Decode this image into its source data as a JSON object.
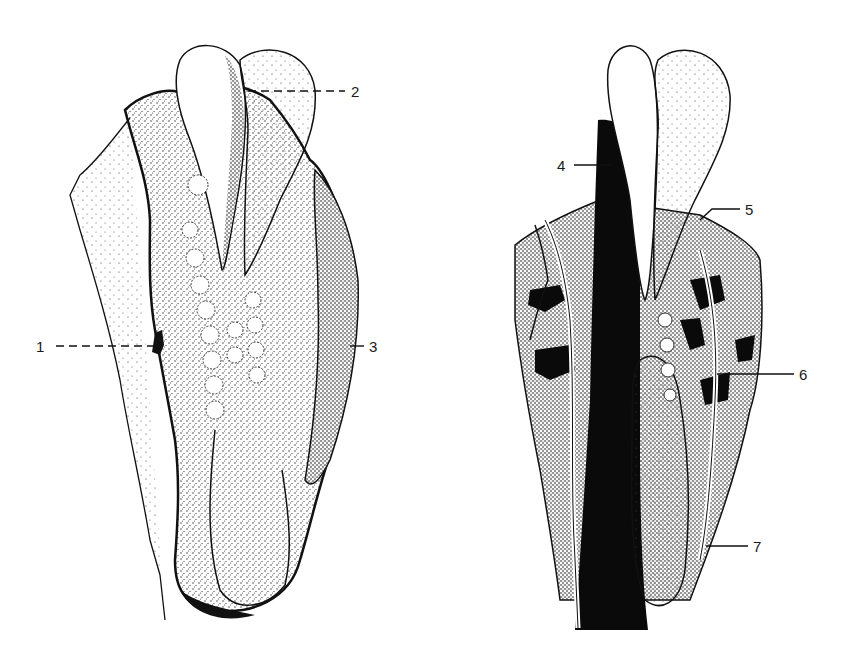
{
  "figure": {
    "panels": [
      {
        "id": "left",
        "description": "external view of stippled embryonic structure with paired distal lobes"
      },
      {
        "id": "right",
        "description": "sectioned view of the same structure showing dark internal cavity"
      }
    ],
    "labels": [
      {
        "text": "1",
        "x": 36,
        "y": 339,
        "leader": "dashed",
        "x1": 56,
        "y1": 346,
        "x2": 158,
        "y2": 346
      },
      {
        "text": "2",
        "x": 351,
        "y": 84,
        "leader": "dashed",
        "x1": 248,
        "y1": 91,
        "x2": 345,
        "y2": 91
      },
      {
        "text": "3",
        "x": 369,
        "y": 339,
        "leader": "solid",
        "x1": 350,
        "y1": 346,
        "x2": 362,
        "y2": 346
      },
      {
        "text": "4",
        "x": 557,
        "y": 158,
        "leader": "solid",
        "x1": 574,
        "y1": 165,
        "x2": 611,
        "y2": 165
      },
      {
        "text": "5",
        "x": 745,
        "y": 209,
        "leader": "solid",
        "x1": 708,
        "y1": 216,
        "x2": 740,
        "y2": 216
      },
      {
        "text": "6",
        "x": 799,
        "y": 367,
        "leader": "solid",
        "x1": 717,
        "y1": 374,
        "x2": 794,
        "y2": 374
      },
      {
        "text": "7",
        "x": 753,
        "y": 539,
        "leader": "solid",
        "x1": 706,
        "y1": 546,
        "x2": 748,
        "y2": 546
      }
    ],
    "colors": {
      "ink": "#111111",
      "paper": "#ffffff",
      "stipple": "#333333"
    }
  }
}
